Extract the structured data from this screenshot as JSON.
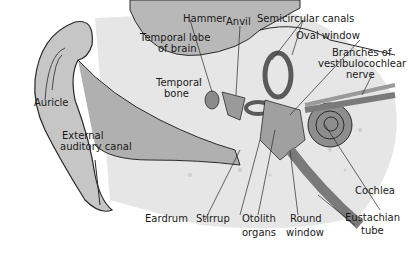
{
  "diagram": {
    "labels": {
      "auricle": "Auricle",
      "external_canal_1": "External",
      "external_canal_2": "auditory canal",
      "temporal_lobe_1": "Temporal lobe",
      "temporal_lobe_2": "of brain",
      "temporal_bone_1": "Temporal",
      "temporal_bone_2": "bone",
      "hammer": "Hammer",
      "anvil": "Anvil",
      "semicircular": "Semicircular canals",
      "oval_window": "Oval window",
      "branches_1": "Branches of",
      "branches_2": "vestibulocochlear",
      "branches_3": "nerve",
      "cochlea": "Cochlea",
      "eustachian_1": "Eustachian",
      "eustachian_2": "tube",
      "eardrum": "Eardrum",
      "stirrup": "Stirrup",
      "otolith_1": "Otolith",
      "otolith_2": "organs",
      "round_1": "Round",
      "round_2": "window"
    },
    "colors": {
      "outline": "#2a2a2a",
      "skin": "#c8c8c8",
      "bone": "#e4e4e4",
      "dark": "#8a8a8a",
      "brain": "#b4b4b4"
    }
  }
}
